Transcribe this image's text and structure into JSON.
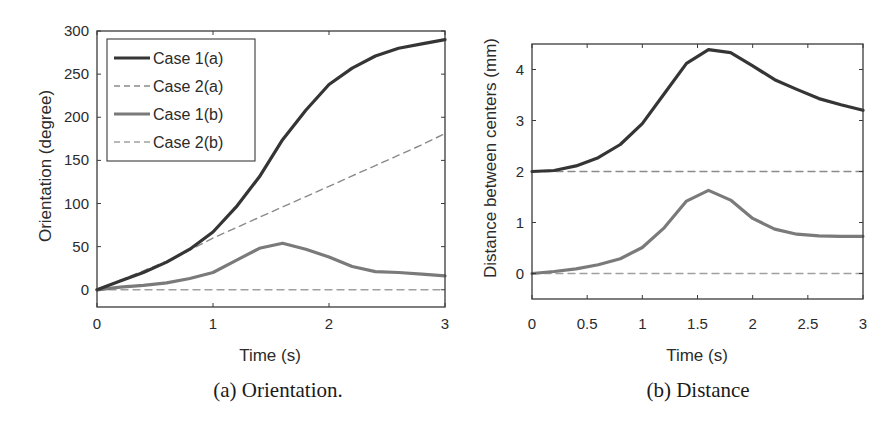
{
  "chart_data": [
    {
      "id": "a",
      "type": "line",
      "caption": "(a) Orientation.",
      "xlabel": "Time (s)",
      "ylabel": "Orientation (degree)",
      "xlim": [
        0,
        3
      ],
      "ylim": [
        -20,
        300
      ],
      "xticks": [
        0,
        1,
        2,
        3
      ],
      "xtick_labels": [
        "0",
        "1",
        "2",
        "3"
      ],
      "yticks": [
        0,
        50,
        100,
        150,
        200,
        250,
        300
      ],
      "ytick_labels": [
        "0",
        "50",
        "100",
        "150",
        "200",
        "250",
        "300"
      ],
      "grid": false,
      "legend_position": "upper left",
      "legend": [
        "Case 1(a)",
        "Case 2(a)",
        "Case 1(b)",
        "Case 2(b)"
      ],
      "x": [
        0,
        0.2,
        0.4,
        0.6,
        0.8,
        1.0,
        1.2,
        1.4,
        1.6,
        1.8,
        2.0,
        2.2,
        2.4,
        2.6,
        2.8,
        3.0
      ],
      "series": [
        {
          "name": "Case 1(a)",
          "style": "solid",
          "color": "#353535",
          "width": 3.2,
          "values": [
            0,
            10,
            20,
            32,
            47,
            67,
            96,
            131,
            174,
            208,
            238,
            257,
            271,
            280,
            285,
            290
          ]
        },
        {
          "name": "Case 2(a)",
          "style": "dashed",
          "color": "#8a8a8a",
          "width": 1.4,
          "values": [
            0,
            11,
            22,
            33,
            46,
            60,
            72,
            84,
            96,
            108,
            120,
            132,
            144,
            156,
            168,
            181
          ]
        },
        {
          "name": "Case 1(b)",
          "style": "solid",
          "color": "#7a7a7a",
          "width": 3.2,
          "values": [
            0,
            3,
            5,
            8,
            13,
            20,
            34,
            48,
            54,
            47,
            38,
            27,
            21,
            20,
            18,
            16
          ]
        },
        {
          "name": "Case 2(b)",
          "style": "dashed",
          "color": "#a0a0a0",
          "width": 1.4,
          "values": [
            0,
            0,
            0,
            0,
            0,
            0,
            0,
            0,
            0,
            0,
            0,
            0,
            0,
            0,
            0,
            0
          ]
        }
      ]
    },
    {
      "id": "b",
      "type": "line",
      "caption": "(b) Distance",
      "xlabel": "Time (s)",
      "ylabel": "Distance between centers (mm)",
      "xlim": [
        0,
        3
      ],
      "ylim": [
        -0.5,
        4.5
      ],
      "xticks": [
        0,
        0.5,
        1,
        1.5,
        2,
        2.5,
        3
      ],
      "xtick_labels": [
        "0",
        "0.5",
        "1",
        "1.5",
        "2",
        "2.5",
        "3"
      ],
      "yticks": [
        0,
        1,
        2,
        3,
        4
      ],
      "ytick_labels": [
        "0",
        "1",
        "2",
        "3",
        "4"
      ],
      "grid": false,
      "legend": [],
      "x": [
        0,
        0.2,
        0.4,
        0.6,
        0.8,
        1.0,
        1.2,
        1.4,
        1.6,
        1.8,
        2.0,
        2.2,
        2.4,
        2.6,
        2.8,
        3.0
      ],
      "series": [
        {
          "name": "Case 1(a)",
          "style": "solid",
          "color": "#353535",
          "width": 3.2,
          "values": [
            2.0,
            2.02,
            2.11,
            2.27,
            2.53,
            2.94,
            3.53,
            4.12,
            4.39,
            4.33,
            4.07,
            3.8,
            3.61,
            3.43,
            3.31,
            3.2
          ]
        },
        {
          "name": "Case 2(a)",
          "style": "dashed",
          "color": "#8a8a8a",
          "width": 1.4,
          "values": [
            2.0,
            2.0,
            2.0,
            2.0,
            2.0,
            2.0,
            2.0,
            2.0,
            2.0,
            2.0,
            2.0,
            2.0,
            2.0,
            2.0,
            2.0,
            2.0
          ]
        },
        {
          "name": "Case 1(b)",
          "style": "solid",
          "color": "#7a7a7a",
          "width": 3.2,
          "values": [
            0,
            0.04,
            0.09,
            0.17,
            0.29,
            0.51,
            0.9,
            1.42,
            1.63,
            1.44,
            1.08,
            0.87,
            0.77,
            0.74,
            0.73,
            0.73
          ]
        },
        {
          "name": "Case 2(b)",
          "style": "dashed",
          "color": "#a0a0a0",
          "width": 1.4,
          "values": [
            0,
            0,
            0,
            0,
            0,
            0,
            0,
            0,
            0,
            0,
            0,
            0,
            0,
            0,
            0,
            0
          ]
        }
      ]
    }
  ]
}
